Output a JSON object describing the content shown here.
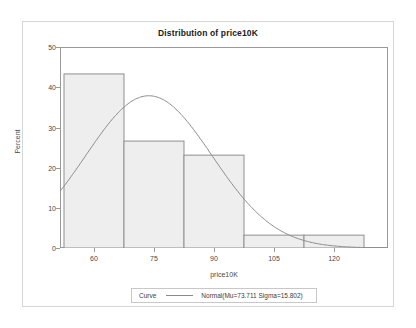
{
  "chart_data": {
    "type": "bar",
    "title": "Distribution of price10K",
    "xlabel": "price10K",
    "ylabel": "Percent",
    "xlim": [
      51.5,
      133.5
    ],
    "ylim": [
      0,
      50
    ],
    "xticks": [
      "60",
      "75",
      "90",
      "105",
      "120"
    ],
    "xtick_values": [
      60,
      75,
      90,
      105,
      120
    ],
    "yticks": [
      "0",
      "10",
      "20",
      "30",
      "40",
      "50"
    ],
    "ytick_values": [
      0,
      10,
      20,
      30,
      40,
      50
    ],
    "grid": false,
    "bin_edges": [
      52.5,
      67.5,
      82.5,
      97.5,
      112.5,
      127.5
    ],
    "bin_centers": [
      60,
      75,
      90,
      105,
      120
    ],
    "categories": [
      "52.5-67.5",
      "67.5-82.5",
      "82.5-97.5",
      "97.5-112.5",
      "112.5-127.5"
    ],
    "values": [
      43.3,
      26.6,
      23.1,
      3.2,
      3.2
    ],
    "bar_fill": "#eeeeee",
    "bar_stroke": "#8f8f8f",
    "overlay": {
      "type": "line",
      "name": "Normal(Mu=73.711 Sigma=15.802)",
      "mu": 73.711,
      "sigma": 15.802,
      "scale_percent_per_bin": 15,
      "color": "#8b8b8b",
      "peak_percent": 37.3,
      "left_endpoint_percent": 14.4
    },
    "legend": {
      "position": "bottom",
      "title": "Curve",
      "entries": [
        "Normal(Mu=73.711 Sigma=15.802)"
      ]
    }
  },
  "legend": {
    "title": "Curve",
    "entry_label": "Normal(Mu=73.711 Sigma=15.802)"
  }
}
